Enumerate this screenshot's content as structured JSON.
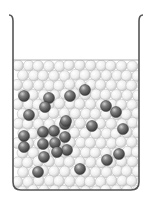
{
  "diagram": {
    "type": "beaker-particle-model",
    "beaker": {
      "left": 13,
      "right": 139,
      "top": 15,
      "bottom": 190,
      "liquid_top": 60,
      "corner_radius": 8,
      "wall_color": "#555555"
    },
    "solvent_particle": {
      "radius": 5.5,
      "color": "#f2f2f2",
      "edge": "#b8b8b8"
    },
    "solute_particle": {
      "radius": 5.5,
      "color": "#6a6a6a",
      "edge": "#3a3a3a"
    },
    "solute_particles": [
      [
        24,
        96
      ],
      [
        49,
        98
      ],
      [
        70,
        96
      ],
      [
        85,
        90
      ],
      [
        29,
        115
      ],
      [
        45,
        107
      ],
      [
        106,
        106
      ],
      [
        116,
        112
      ],
      [
        92,
        126
      ],
      [
        123,
        129
      ],
      [
        65,
        124
      ],
      [
        43,
        132
      ],
      [
        54,
        131
      ],
      [
        66,
        121
      ],
      [
        24,
        136
      ],
      [
        24,
        147
      ],
      [
        43,
        144
      ],
      [
        55,
        143
      ],
      [
        65,
        137
      ],
      [
        67,
        150
      ],
      [
        44,
        157
      ],
      [
        57,
        152
      ],
      [
        107,
        160
      ],
      [
        119,
        154
      ],
      [
        38,
        172
      ],
      [
        80,
        169
      ]
    ]
  }
}
